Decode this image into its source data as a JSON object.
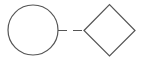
{
  "diagram": {
    "nodes": [
      {
        "id": "node-circle",
        "shape": "circle",
        "label": ""
      },
      {
        "id": "node-diamond",
        "shape": "diamond",
        "label": ""
      }
    ],
    "edges": [
      {
        "from": "node-circle",
        "to": "node-diamond",
        "style": "dashed",
        "label": ""
      }
    ],
    "colors": {
      "stroke": "#555555",
      "fill": "#ffffff",
      "background": "#ffffff"
    }
  }
}
